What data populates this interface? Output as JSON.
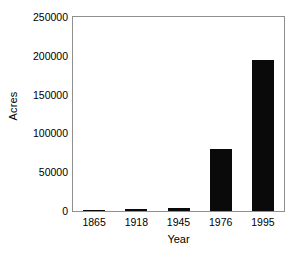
{
  "chart_data": {
    "type": "bar",
    "title": "",
    "subtitle": "",
    "xlabel": "Year",
    "ylabel": "Acres",
    "categories": [
      "1865",
      "1918",
      "1945",
      "1976",
      "1995"
    ],
    "values": [
      1500,
      2500,
      3500,
      80000,
      195000
    ],
    "series": [
      {
        "name": "Acres",
        "values": [
          1500,
          2500,
          3500,
          80000,
          195000
        ]
      }
    ],
    "ylim": [
      0,
      250000
    ],
    "yticks": [
      0,
      50000,
      100000,
      150000,
      200000,
      250000
    ],
    "ytick_labels": [
      "0",
      "50000",
      "100000",
      "150000",
      "200000",
      "250000"
    ],
    "xtick_labels": [
      "1865",
      "1918",
      "1945",
      "1976",
      "1995"
    ],
    "grid": false,
    "legend": false,
    "legend_position": "none",
    "bar_color": "#0a0a0a",
    "frame_color": "#8f8f8f",
    "background_color": "#ffffff",
    "annotations": []
  }
}
